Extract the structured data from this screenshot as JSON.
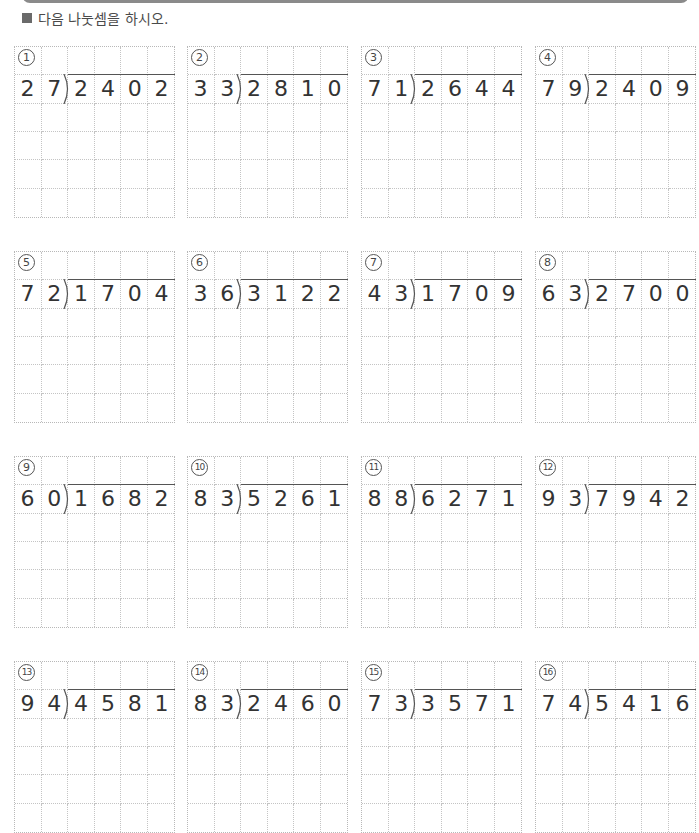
{
  "header": {
    "instruction": "다음 나눗셈을 하시오."
  },
  "problems": [
    {
      "label": "1",
      "divisor": [
        "2",
        "7"
      ],
      "dividend": [
        "2",
        "4",
        "0",
        "2"
      ]
    },
    {
      "label": "2",
      "divisor": [
        "3",
        "3"
      ],
      "dividend": [
        "2",
        "8",
        "1",
        "0"
      ]
    },
    {
      "label": "3",
      "divisor": [
        "7",
        "1"
      ],
      "dividend": [
        "2",
        "6",
        "4",
        "4"
      ]
    },
    {
      "label": "4",
      "divisor": [
        "7",
        "9"
      ],
      "dividend": [
        "2",
        "4",
        "0",
        "9"
      ]
    },
    {
      "label": "5",
      "divisor": [
        "7",
        "2"
      ],
      "dividend": [
        "1",
        "7",
        "0",
        "4"
      ]
    },
    {
      "label": "6",
      "divisor": [
        "3",
        "6"
      ],
      "dividend": [
        "3",
        "1",
        "2",
        "2"
      ]
    },
    {
      "label": "7",
      "divisor": [
        "4",
        "3"
      ],
      "dividend": [
        "1",
        "7",
        "0",
        "9"
      ]
    },
    {
      "label": "8",
      "divisor": [
        "6",
        "3"
      ],
      "dividend": [
        "2",
        "7",
        "0",
        "0"
      ]
    },
    {
      "label": "9",
      "divisor": [
        "6",
        "0"
      ],
      "dividend": [
        "1",
        "6",
        "8",
        "2"
      ]
    },
    {
      "label": "10",
      "divisor": [
        "8",
        "3"
      ],
      "dividend": [
        "5",
        "2",
        "6",
        "1"
      ]
    },
    {
      "label": "11",
      "divisor": [
        "8",
        "8"
      ],
      "dividend": [
        "6",
        "2",
        "7",
        "1"
      ]
    },
    {
      "label": "12",
      "divisor": [
        "9",
        "3"
      ],
      "dividend": [
        "7",
        "9",
        "4",
        "2"
      ]
    },
    {
      "label": "13",
      "divisor": [
        "9",
        "4"
      ],
      "dividend": [
        "4",
        "5",
        "8",
        "1"
      ]
    },
    {
      "label": "14",
      "divisor": [
        "8",
        "3"
      ],
      "dividend": [
        "2",
        "4",
        "6",
        "0"
      ]
    },
    {
      "label": "15",
      "divisor": [
        "7",
        "3"
      ],
      "dividend": [
        "3",
        "5",
        "7",
        "1"
      ]
    },
    {
      "label": "16",
      "divisor": [
        "7",
        "4"
      ],
      "dividend": [
        "5",
        "4",
        "1",
        "6"
      ]
    }
  ]
}
